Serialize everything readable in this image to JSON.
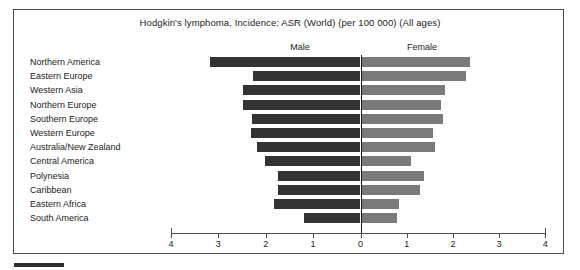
{
  "chart_data": {
    "type": "bar",
    "subtype": "diverging-population-pyramid",
    "title": "Hodgkin's lymphoma, Incidence: ASR (World) (per 100 000) (All ages)",
    "xlabel": "",
    "ylabel": "",
    "xlim": [
      -4,
      4
    ],
    "grid": false,
    "legend_position": "top-inline",
    "axis_ticks": [
      {
        "label": "4",
        "value": -4
      },
      {
        "label": "3",
        "value": -3
      },
      {
        "label": "2",
        "value": -2
      },
      {
        "label": "1",
        "value": -1
      },
      {
        "label": "0",
        "value": 0
      },
      {
        "label": "1",
        "value": 1
      },
      {
        "label": "2",
        "value": 2
      },
      {
        "label": "3",
        "value": 3
      },
      {
        "label": "4",
        "value": 4
      }
    ],
    "categories": [
      "Northern America",
      "Eastern Europe",
      "Western Asia",
      "Northern Europe",
      "Southern Europe",
      "Western Europe",
      "Australia/New Zealand",
      "Central America",
      "Polynesia",
      "Caribbean",
      "Eastern Africa",
      "South America"
    ],
    "series": [
      {
        "name": "Male",
        "color": "#333333",
        "direction": "left",
        "values": [
          3.18,
          2.27,
          2.48,
          2.48,
          2.29,
          2.31,
          2.19,
          2.02,
          1.75,
          1.75,
          1.83,
          1.2
        ]
      },
      {
        "name": "Female",
        "color": "#7a7a7a",
        "direction": "right",
        "values": [
          2.35,
          2.27,
          1.81,
          1.73,
          1.77,
          1.55,
          1.6,
          1.08,
          1.35,
          1.27,
          0.82,
          0.77
        ]
      }
    ]
  },
  "footer": {
    "marker": ""
  }
}
